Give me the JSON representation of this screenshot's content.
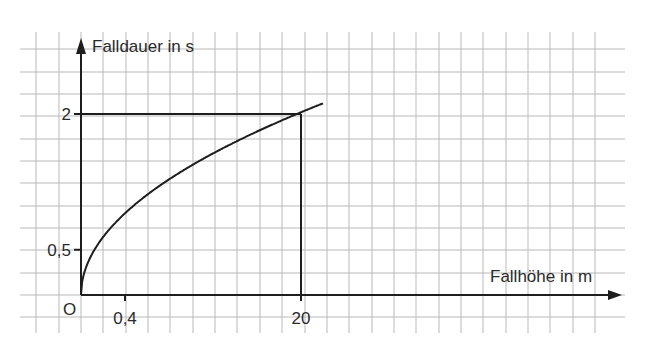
{
  "chart_data": {
    "type": "line",
    "title": "",
    "xlabel": "Fallhöhe in m",
    "ylabel": "Falldauer in s",
    "origin_label": "O",
    "x_ticks": [
      {
        "value": 4,
        "label": "0,4"
      },
      {
        "value": 20,
        "label": "20"
      }
    ],
    "y_ticks": [
      {
        "value": 0.5,
        "label": "0,5"
      },
      {
        "value": 2,
        "label": "2"
      }
    ],
    "grid": true,
    "legend": null,
    "xlim": [
      0,
      49
    ],
    "ylim": [
      0,
      2.7
    ],
    "series": [
      {
        "name": "Falldauer",
        "formula": "t = sqrt(2h/9.81)",
        "x": [
          0,
          0.5,
          1,
          2,
          3,
          4,
          6,
          8,
          10,
          12,
          14,
          16,
          18,
          20,
          22
        ],
        "y": [
          0,
          0.32,
          0.45,
          0.64,
          0.78,
          0.9,
          1.11,
          1.28,
          1.43,
          1.56,
          1.69,
          1.81,
          1.92,
          2.02,
          2.12
        ]
      }
    ],
    "annotations": [
      {
        "type": "guide-line",
        "from": [
          0,
          2
        ],
        "to": [
          20,
          2
        ]
      },
      {
        "type": "guide-line",
        "from": [
          20,
          0
        ],
        "to": [
          20,
          2
        ]
      }
    ]
  }
}
